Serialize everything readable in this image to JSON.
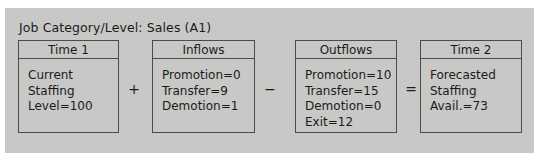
{
  "figure": {
    "title": "Job Category/Level: Sales (A1)",
    "background_color": "#c8c8c6",
    "border_color": "#4c4c4c",
    "text_color": "#1b1b1b"
  },
  "boxes": [
    {
      "key": "time1",
      "header": "Time 1",
      "lines": [
        "Current",
        "Staffing",
        "Level=100"
      ]
    },
    {
      "key": "inflows",
      "header": "Inflows",
      "lines": [
        "Promotion=0",
        "Transfer=9",
        "Demotion=1"
      ]
    },
    {
      "key": "outflows",
      "header": "Outflows",
      "lines": [
        "Promotion=10",
        "Transfer=15",
        "Demotion=0",
        "Exit=12"
      ]
    },
    {
      "key": "time2",
      "header": "Time 2",
      "lines": [
        "Forecasted",
        "Staffing",
        "Avail.=73"
      ]
    }
  ],
  "operators": {
    "plus": "+",
    "minus": "−",
    "equals": "="
  }
}
